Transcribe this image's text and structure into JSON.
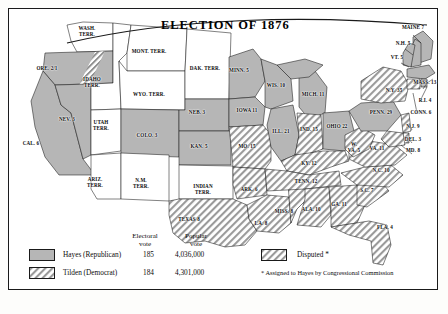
{
  "map": {
    "title": "ELECTION OF 1876",
    "states": [
      {
        "name": "WASH.\nTERR.",
        "votes": "",
        "party": "territory",
        "lx": 78,
        "ly": 22
      },
      {
        "name": "ORE.",
        "votes": "2/1",
        "party": "disputed-partial",
        "lx": 38,
        "ly": 62
      },
      {
        "name": "CAL.",
        "votes": "6",
        "party": "hayes",
        "lx": 22,
        "ly": 137
      },
      {
        "name": "NEV.",
        "votes": "3",
        "party": "hayes",
        "lx": 58,
        "ly": 113
      },
      {
        "name": "IDAHO\nTERR.",
        "votes": "",
        "party": "territory",
        "lx": 83,
        "ly": 73
      },
      {
        "name": "MONT. TERR.",
        "votes": "",
        "party": "territory",
        "lx": 140,
        "ly": 45
      },
      {
        "name": "WYO. TERR.",
        "votes": "",
        "party": "territory",
        "lx": 140,
        "ly": 88
      },
      {
        "name": "UTAH\nTERR.",
        "votes": "",
        "party": "territory",
        "lx": 92,
        "ly": 116
      },
      {
        "name": "COLO.",
        "votes": "3",
        "party": "hayes",
        "lx": 138,
        "ly": 129
      },
      {
        "name": "ARIZ.\nTERR.",
        "votes": "",
        "party": "territory",
        "lx": 86,
        "ly": 173
      },
      {
        "name": "N.M.\nTERR.",
        "votes": "",
        "party": "territory",
        "lx": 132,
        "ly": 174
      },
      {
        "name": "DAK. TERR.",
        "votes": "",
        "party": "territory",
        "lx": 196,
        "ly": 62
      },
      {
        "name": "NEB.",
        "votes": "3",
        "party": "hayes",
        "lx": 188,
        "ly": 106
      },
      {
        "name": "KAN.",
        "votes": "5",
        "party": "hayes",
        "lx": 190,
        "ly": 140
      },
      {
        "name": "INDIAN\nTERR.",
        "votes": "",
        "party": "territory",
        "lx": 194,
        "ly": 180
      },
      {
        "name": "TEXAS",
        "votes": "8",
        "party": "tilden",
        "lx": 180,
        "ly": 213
      },
      {
        "name": "MINN.",
        "votes": "5",
        "party": "hayes",
        "lx": 230,
        "ly": 64
      },
      {
        "name": "IOWA",
        "votes": "11",
        "party": "hayes",
        "lx": 238,
        "ly": 104
      },
      {
        "name": "MO.",
        "votes": "15",
        "party": "tilden",
        "lx": 238,
        "ly": 140
      },
      {
        "name": "ARK.",
        "votes": "6",
        "party": "tilden",
        "lx": 240,
        "ly": 183
      },
      {
        "name": "LA.",
        "votes": "8",
        "party": "disputed",
        "lx": 252,
        "ly": 217
      },
      {
        "name": "WIS.",
        "votes": "10",
        "party": "hayes",
        "lx": 267,
        "ly": 79
      },
      {
        "name": "ILL.",
        "votes": "21",
        "party": "hayes",
        "lx": 272,
        "ly": 125
      },
      {
        "name": "MISS.",
        "votes": "8",
        "party": "tilden",
        "lx": 275,
        "ly": 205
      },
      {
        "name": "MICH.",
        "votes": "11",
        "party": "hayes",
        "lx": 304,
        "ly": 88
      },
      {
        "name": "IND.",
        "votes": "15",
        "party": "tilden",
        "lx": 300,
        "ly": 123
      },
      {
        "name": "KY.",
        "votes": "12",
        "party": "tilden",
        "lx": 300,
        "ly": 157
      },
      {
        "name": "TENN.",
        "votes": "12",
        "party": "tilden",
        "lx": 297,
        "ly": 175
      },
      {
        "name": "ALA.",
        "votes": "10",
        "party": "tilden",
        "lx": 302,
        "ly": 203
      },
      {
        "name": "OHIO",
        "votes": "22",
        "party": "hayes",
        "lx": 328,
        "ly": 120
      },
      {
        "name": "W.\nVA.",
        "votes": "5",
        "party": "tilden",
        "lx": 345,
        "ly": 138
      },
      {
        "name": "VA.",
        "votes": "11",
        "party": "tilden",
        "lx": 368,
        "ly": 142
      },
      {
        "name": "N.C.",
        "votes": "10",
        "party": "tilden",
        "lx": 372,
        "ly": 164
      },
      {
        "name": "S.C.",
        "votes": "7",
        "party": "disputed",
        "lx": 358,
        "ly": 184
      },
      {
        "name": "GA.",
        "votes": "11",
        "party": "tilden",
        "lx": 330,
        "ly": 198
      },
      {
        "name": "FLA.",
        "votes": "4",
        "party": "disputed",
        "lx": 376,
        "ly": 221
      },
      {
        "name": "PENN.",
        "votes": "29",
        "party": "hayes",
        "lx": 372,
        "ly": 106
      },
      {
        "name": "N.Y.",
        "votes": "35",
        "party": "tilden",
        "lx": 385,
        "ly": 84
      },
      {
        "name": "MAINE",
        "votes": "7",
        "party": "hayes",
        "lx": 404,
        "ly": 21
      },
      {
        "name": "N.H.",
        "votes": "5",
        "party": "hayes",
        "lx": 394,
        "ly": 37
      },
      {
        "name": "VT.",
        "votes": "5",
        "party": "hayes",
        "lx": 388,
        "ly": 51
      },
      {
        "name": "MASS.",
        "votes": "13",
        "party": "hayes",
        "lx": 416,
        "ly": 76
      },
      {
        "name": "R.I.",
        "votes": "4",
        "party": "hayes",
        "lx": 416,
        "ly": 94
      },
      {
        "name": "CONN.",
        "votes": "6",
        "party": "tilden",
        "lx": 412,
        "ly": 106
      },
      {
        "name": "N.J.",
        "votes": "9",
        "party": "tilden",
        "lx": 404,
        "ly": 120
      },
      {
        "name": "DEL.",
        "votes": "3",
        "party": "tilden",
        "lx": 404,
        "ly": 133
      },
      {
        "name": "MD.",
        "votes": "8",
        "party": "tilden",
        "lx": 404,
        "ly": 144
      }
    ]
  },
  "legend": {
    "header_electoral": "Electoral\nvote",
    "header_popular": "Popular\nvote",
    "rows": [
      {
        "swatch": "hayes-swatch",
        "label": "Hayes (Republican)",
        "electoral": "185",
        "popular": "4,036,000"
      },
      {
        "swatch": "tilden-swatch",
        "label": "Tilden (Democrat)",
        "electoral": "184",
        "popular": "4,301,000"
      }
    ],
    "disputed_label": "Disputed *",
    "footnote": "* Assigned to Hayes by Congressional Commission"
  },
  "colors": {
    "hayes_fill": "#b6b6b6",
    "tilden_fill": "#ffffff",
    "hatch_stroke": "#8e8e8e",
    "border": "#1a1a1a",
    "territory_fill": "#ffffff"
  }
}
